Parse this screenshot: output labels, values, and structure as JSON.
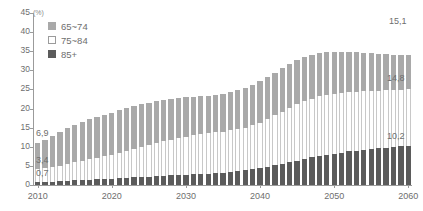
{
  "chart_data": {
    "type": "bar",
    "stacked": true,
    "title": "",
    "subtitle": "",
    "xlabel": "",
    "ylabel": "",
    "unit_label": "(%)",
    "ylim": [
      0,
      45
    ],
    "ytick_step": 5,
    "yticks": [
      "45",
      "40",
      "35",
      "30",
      "25",
      "20",
      "15",
      "10",
      "5",
      "0"
    ],
    "xticks": [
      "2010",
      "2020",
      "2030",
      "2040",
      "2050",
      "2060"
    ],
    "grid": false,
    "legend_position": "top-left",
    "legend": [
      "65~74",
      "75~84",
      "85+"
    ],
    "colors": {
      "65~74": "#a9a9a9",
      "75~84": "#ffffff",
      "85+": "#5b5b5b",
      "axis": "#9b9b9b",
      "text": "#6e6e6e"
    },
    "x": [
      2010,
      2011,
      2012,
      2013,
      2014,
      2015,
      2016,
      2017,
      2018,
      2019,
      2020,
      2021,
      2022,
      2023,
      2024,
      2025,
      2026,
      2027,
      2028,
      2029,
      2030,
      2031,
      2032,
      2033,
      2034,
      2035,
      2036,
      2037,
      2038,
      2039,
      2040,
      2041,
      2042,
      2043,
      2044,
      2045,
      2046,
      2047,
      2048,
      2049,
      2050,
      2051,
      2052,
      2053,
      2054,
      2055,
      2056,
      2057,
      2058,
      2059,
      2060
    ],
    "series": [
      {
        "name": "65~74",
        "values": [
          6.9,
          7.3,
          8.1,
          9.0,
          9.5,
          9.9,
          10.2,
          10.5,
          10.7,
          10.9,
          11.0,
          11.1,
          11.2,
          11.2,
          11.2,
          11.1,
          11.0,
          10.9,
          10.7,
          10.5,
          10.3,
          10.1,
          9.9,
          9.8,
          9.8,
          9.9,
          10.0,
          10.2,
          10.4,
          10.6,
          10.8,
          11.0,
          11.2,
          11.3,
          11.4,
          11.5,
          11.5,
          11.4,
          11.3,
          11.1,
          10.9,
          10.7,
          10.5,
          10.3,
          10.1,
          9.9,
          9.7,
          9.5,
          9.3,
          9.2,
          9.1
        ],
        "first_label": "6,9",
        "last_label": "15,1"
      },
      {
        "name": "75~84",
        "values": [
          3.4,
          3.6,
          3.8,
          4.0,
          4.3,
          4.7,
          5.0,
          5.3,
          5.6,
          5.9,
          6.2,
          6.6,
          7.0,
          7.4,
          7.8,
          8.2,
          8.6,
          9.0,
          9.3,
          9.6,
          9.9,
          10.2,
          10.4,
          10.6,
          10.7,
          10.8,
          10.9,
          11.0,
          11.2,
          11.5,
          11.9,
          12.4,
          13.0,
          13.6,
          14.2,
          14.7,
          15.1,
          15.4,
          15.6,
          15.7,
          15.7,
          15.6,
          15.5,
          15.4,
          15.3,
          15.2,
          15.1,
          15.0,
          14.9,
          14.8,
          14.8
        ],
        "first_label": "3,4",
        "last_label": "14,8"
      },
      {
        "name": "85+",
        "values": [
          0.7,
          0.8,
          0.9,
          1.0,
          1.1,
          1.2,
          1.3,
          1.4,
          1.5,
          1.6,
          1.7,
          1.8,
          1.9,
          2.0,
          2.1,
          2.2,
          2.3,
          2.4,
          2.5,
          2.6,
          2.7,
          2.8,
          2.9,
          3.0,
          3.1,
          3.2,
          3.4,
          3.6,
          3.8,
          4.1,
          4.4,
          4.8,
          5.2,
          5.6,
          6.0,
          6.4,
          6.8,
          7.2,
          7.6,
          7.9,
          8.2,
          8.5,
          8.8,
          9.0,
          9.2,
          9.4,
          9.6,
          9.8,
          9.9,
          10.1,
          10.2
        ],
        "first_label": "0,7",
        "last_label": "10,2"
      }
    ],
    "totals": [
      11.0,
      11.7,
      12.8,
      14.0,
      14.9,
      15.8,
      16.5,
      17.2,
      17.8,
      18.4,
      18.9,
      19.5,
      20.1,
      20.6,
      21.1,
      21.5,
      21.9,
      22.3,
      22.5,
      22.7,
      22.9,
      23.1,
      23.2,
      23.4,
      23.6,
      23.9,
      24.3,
      24.8,
      25.4,
      26.2,
      27.1,
      28.2,
      29.4,
      30.5,
      31.6,
      32.6,
      33.4,
      34.0,
      34.5,
      34.7,
      34.8,
      34.8,
      34.8,
      34.7,
      34.6,
      34.5,
      34.4,
      34.3,
      34.1,
      34.1,
      34.1
    ],
    "annotations": [
      {
        "name": "annotation-2010-65-74",
        "text": "6,9"
      },
      {
        "name": "annotation-2010-75-84",
        "text": "3,4"
      },
      {
        "name": "annotation-2010-85plus",
        "text": "0,7"
      },
      {
        "name": "annotation-2060-65-74",
        "text": "15,1"
      },
      {
        "name": "annotation-2060-75-84",
        "text": "14,8"
      },
      {
        "name": "annotation-2060-85plus",
        "text": "10,2"
      }
    ]
  }
}
